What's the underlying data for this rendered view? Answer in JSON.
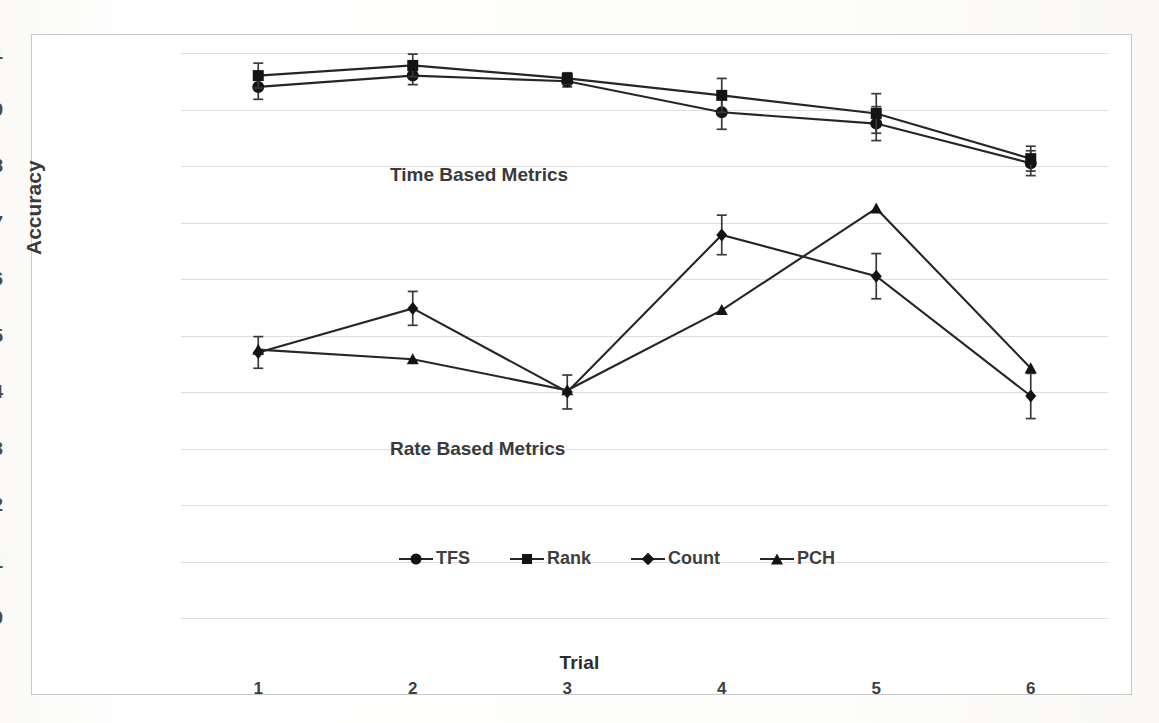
{
  "chart_data": {
    "type": "line",
    "title": "",
    "xlabel": "Trial",
    "ylabel": "Accuracy",
    "categories": [
      "1",
      "2",
      "3",
      "4",
      "5",
      "6"
    ],
    "x": [
      1,
      2,
      3,
      4,
      5,
      6
    ],
    "ylim": [
      0,
      1
    ],
    "xlim": [
      0.5,
      6.5
    ],
    "ytick_labels": [
      "1",
      "0.9",
      "0.8",
      "0.7",
      "0.6",
      "0.5",
      "0.4",
      "0.3",
      "0.2",
      "0.1",
      "0"
    ],
    "ytick_values": [
      1,
      0.9,
      0.8,
      0.7,
      0.6,
      0.5,
      0.4,
      0.3,
      0.2,
      0.1,
      0
    ],
    "grid": "horizontal",
    "legend_position": "inside-lower-left",
    "error_bars": true,
    "line_color": "#262626",
    "marker_color": "#141414",
    "grid_color": "#dedede",
    "series": [
      {
        "name": "TFS",
        "marker": "circle",
        "values": [
          0.94,
          0.96,
          0.95,
          0.895,
          0.875,
          0.805
        ],
        "errors": [
          0.022,
          0.016,
          0.01,
          0.03,
          0.03,
          0.022
        ]
      },
      {
        "name": "Rank",
        "marker": "square",
        "values": [
          0.96,
          0.978,
          0.955,
          0.925,
          0.893,
          0.813
        ],
        "errors": [
          0.022,
          0.02,
          0.01,
          0.03,
          0.035,
          0.022
        ]
      },
      {
        "name": "Count",
        "marker": "diamond",
        "values": [
          0.47,
          0.548,
          0.4,
          0.678,
          0.605,
          0.393
        ],
        "errors": [
          0.028,
          0.03,
          0.03,
          0.035,
          0.04,
          0.04
        ]
      },
      {
        "name": "PCH",
        "marker": "triangle",
        "values": [
          0.475,
          0.458,
          0.403,
          0.545,
          0.725,
          0.442
        ]
      }
    ],
    "annotations": [
      {
        "text": "Time Based Metrics",
        "x": 1.15,
        "y": 0.885
      },
      {
        "text": "Rate Based Metrics",
        "x": 1.15,
        "y": 0.405
      }
    ]
  },
  "legend": {
    "items": [
      {
        "label": "TFS",
        "marker": "circle-marker"
      },
      {
        "label": "Rank",
        "marker": "square-marker"
      },
      {
        "label": "Count",
        "marker": "diamond-marker"
      },
      {
        "label": "PCH",
        "marker": "triangle-marker"
      }
    ]
  },
  "axes": {
    "y_title": "Accuracy",
    "x_title": "Trial"
  },
  "annotations": {
    "time_based": "Time Based Metrics",
    "rate_based": "Rate Based Metrics"
  }
}
